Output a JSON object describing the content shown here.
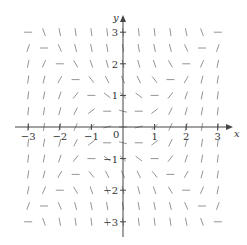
{
  "diagram": {
    "type": "slope_field",
    "equation": "dy/dx = x^2 - y^2",
    "x_axis": {
      "label": "x",
      "ticks": [
        -3,
        -2,
        -1,
        1,
        2,
        3
      ],
      "range": [
        -3.4,
        3.4
      ]
    },
    "y_axis": {
      "label": "y",
      "ticks": [
        3,
        2,
        1,
        -1,
        -2,
        -3
      ],
      "range": [
        -3.4,
        3.5
      ]
    },
    "origin_label": "0",
    "grid": {
      "x_min": -3,
      "x_max": 3,
      "y_min": -3,
      "y_max": 3,
      "step": 0.5
    },
    "colors": {
      "axis": "#444444",
      "segment": "#888888",
      "text": "#333333"
    },
    "layout": {
      "origin_px": [
        123,
        127
      ],
      "px_per_unit": 31.6,
      "segment_length_px": 8
    }
  }
}
